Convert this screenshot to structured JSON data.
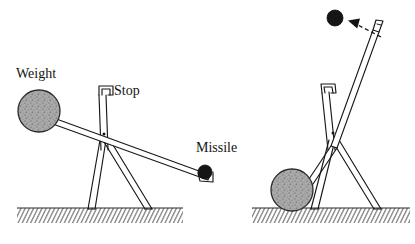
{
  "figure": {
    "background_color": "#ffffff",
    "width": 415,
    "height": 244,
    "panels": [
      {
        "id": "left-panel",
        "state_label": "loaded",
        "description": "Trebuchet armed: counterweight raised, arm held against the stop, missile resting in the cup at the low end of the arm."
      },
      {
        "id": "right-panel",
        "state_label": "released",
        "description": "Trebuchet after release: counterweight has fallen to the ground, arm has swung upward, missile flies away along the dashed trajectory."
      }
    ]
  },
  "labels": {
    "weight": "Weight",
    "stop": "Stop",
    "missile": "Missile"
  },
  "colors": {
    "ink": "#181818",
    "weight_fill": "#a3a3a3",
    "missile_fill": "#151515",
    "ground_hatch": "#2e2e2e",
    "background": "#ffffff"
  },
  "label_positions": {
    "weight": {
      "x": 16,
      "y": 78
    },
    "stop": {
      "x": 112,
      "y": 94
    },
    "missile": {
      "x": 196,
      "y": 152
    }
  },
  "elements": {
    "left": {
      "weight_ball": {
        "cx": 39,
        "cy": 111,
        "r": 21
      },
      "missile_ball": {
        "cx": 205,
        "cy": 172,
        "r": 7
      },
      "pivot": {
        "x": 104,
        "y": 135
      },
      "ground": {
        "x": 17,
        "y": 208,
        "width": 166,
        "height": 15
      }
    },
    "right": {
      "weight_ball": {
        "cx": 292,
        "cy": 190,
        "r": 21
      },
      "missile_ball": {
        "cx": 335,
        "cy": 18,
        "r": 8
      },
      "pivot": {
        "x": 332,
        "y": 133
      },
      "ground": {
        "x": 252,
        "y": 208,
        "width": 158,
        "height": 15
      },
      "trajectory_arrow": {
        "from_x": 382,
        "from_y": 38,
        "to_x": 349,
        "to_y": 22,
        "style": "dashed"
      }
    }
  }
}
